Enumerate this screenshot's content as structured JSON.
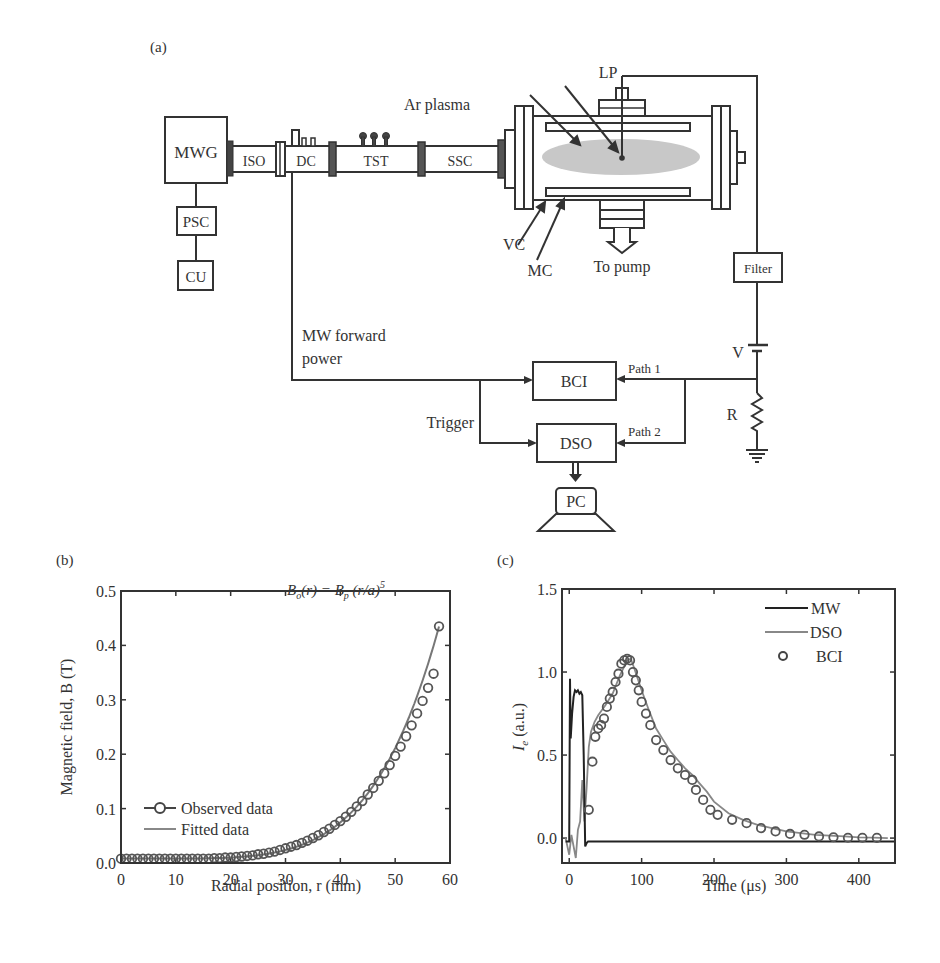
{
  "panel_a": {
    "label": "(a)",
    "components": {
      "mwg": "MWG",
      "psc": "PSC",
      "cu": "CU",
      "iso": "ISO",
      "dc": "DC",
      "tst": "TST",
      "ssc": "SSC",
      "ar_plasma": "Ar plasma",
      "lp": "LP",
      "vc": "VC",
      "mc": "MC",
      "to_pump": "To pump",
      "filter": "Filter",
      "v": "V",
      "r": "R",
      "bci": "BCI",
      "dso": "DSO",
      "pc": "PC",
      "mw_forward_power_1": "MW forward",
      "mw_forward_power_2": "power",
      "trigger": "Trigger",
      "path1": "Path 1",
      "path2": "Path 2"
    }
  },
  "chart_data": [
    {
      "panel": "(b)",
      "type": "scatter",
      "title": "",
      "annotation": "B_o(r) = B_p (r/a)^5",
      "annotation_parts": {
        "b0": "B",
        "sub0": "o",
        "mid": "(r) = ",
        "bp": "B",
        "subp": "p",
        "tail": " (r/a)",
        "sup": "5"
      },
      "xlabel": "Radial position, r (mm)",
      "ylabel": "Magnetic field, B (T)",
      "xlim": [
        0,
        60
      ],
      "ylim": [
        0,
        0.5
      ],
      "xticks": [
        "0",
        "10",
        "20",
        "30",
        "40",
        "50",
        "60"
      ],
      "yticks": [
        "0.0",
        "0.1",
        "0.2",
        "0.3",
        "0.4",
        "0.5"
      ],
      "legend": [
        "Observed data",
        "Fitted data"
      ],
      "legend_position": "lower left",
      "series": [
        {
          "name": "Observed data",
          "marker": "open-circle",
          "x": [
            0,
            1,
            2,
            3,
            4,
            5,
            6,
            7,
            8,
            9,
            10,
            11,
            12,
            13,
            14,
            15,
            16,
            17,
            18,
            19,
            20,
            21,
            22,
            23,
            24,
            25,
            26,
            27,
            28,
            29,
            30,
            31,
            32,
            33,
            34,
            35,
            36,
            37,
            38,
            39,
            40,
            41,
            42,
            43,
            44,
            45,
            46,
            47,
            48,
            49,
            50,
            51,
            52,
            53,
            54,
            55,
            56,
            57,
            58
          ],
          "y": [
            0.008,
            0.008,
            0.008,
            0.008,
            0.008,
            0.008,
            0.008,
            0.008,
            0.008,
            0.008,
            0.008,
            0.008,
            0.008,
            0.008,
            0.008,
            0.008,
            0.008,
            0.009,
            0.009,
            0.01,
            0.01,
            0.011,
            0.012,
            0.013,
            0.014,
            0.016,
            0.017,
            0.019,
            0.021,
            0.024,
            0.027,
            0.03,
            0.033,
            0.037,
            0.041,
            0.046,
            0.051,
            0.057,
            0.063,
            0.07,
            0.077,
            0.085,
            0.094,
            0.104,
            0.114,
            0.126,
            0.138,
            0.151,
            0.165,
            0.18,
            0.197,
            0.214,
            0.233,
            0.253,
            0.275,
            0.298,
            0.322,
            0.348,
            0.435
          ]
        },
        {
          "name": "Fitted data",
          "marker": "line"
        }
      ]
    },
    {
      "panel": "(c)",
      "type": "line",
      "title": "",
      "xlabel": "Time (μs)",
      "ylabel": "I_e (a.u.)",
      "ylabel_parts": {
        "main": "I",
        "sub": "e",
        "tail": " (a.u.)"
      },
      "xlim": [
        -10,
        450
      ],
      "ylim": [
        -0.15,
        1.5
      ],
      "xticks": [
        "0",
        "100",
        "200",
        "300",
        "400"
      ],
      "yticks": [
        "0.0",
        "0.5",
        "1.0",
        "1.5"
      ],
      "legend": [
        "MW",
        "DSO",
        "BCI"
      ],
      "legend_position": "upper right",
      "series": [
        {
          "name": "MW",
          "marker": "line",
          "x": [
            -5,
            0,
            1,
            2,
            4,
            6,
            8,
            10,
            12,
            14,
            16,
            18,
            20,
            22,
            24,
            26,
            30,
            100,
            200,
            300,
            400,
            450
          ],
          "y": [
            -0.02,
            -0.02,
            0.96,
            0.6,
            0.75,
            0.85,
            0.89,
            0.88,
            0.89,
            0.87,
            0.88,
            0.86,
            0.5,
            -0.05,
            -0.03,
            -0.02,
            -0.02,
            -0.02,
            -0.02,
            -0.02,
            -0.02,
            -0.02
          ]
        },
        {
          "name": "DSO",
          "marker": "line",
          "x": [
            -5,
            0,
            3,
            6,
            9,
            12,
            15,
            18,
            21,
            24,
            27,
            30,
            35,
            40,
            50,
            60,
            70,
            80,
            85,
            90,
            100,
            110,
            120,
            130,
            140,
            150,
            160,
            170,
            180,
            190,
            200,
            220,
            240,
            260,
            280,
            300,
            320,
            340,
            360,
            380,
            400,
            420,
            440
          ],
          "y": [
            0,
            -0.1,
            0.02,
            -0.05,
            -0.12,
            0.05,
            0.1,
            0.35,
            0.1,
            0.3,
            0.55,
            0.64,
            0.7,
            0.74,
            0.8,
            0.87,
            0.98,
            1.07,
            1.08,
            1.02,
            0.89,
            0.77,
            0.66,
            0.59,
            0.52,
            0.47,
            0.42,
            0.38,
            0.33,
            0.28,
            0.22,
            0.15,
            0.11,
            0.08,
            0.06,
            0.04,
            0.03,
            0.02,
            0.015,
            0.01,
            0.005,
            0.003,
            0.0
          ]
        },
        {
          "name": "BCI",
          "marker": "open-circle",
          "x": [
            27,
            32,
            36,
            40,
            44,
            48,
            52,
            56,
            60,
            64,
            68,
            72,
            76,
            80,
            84,
            88,
            92,
            96,
            100,
            106,
            112,
            120,
            130,
            140,
            150,
            160,
            170,
            175,
            185,
            195,
            205,
            225,
            245,
            265,
            285,
            305,
            325,
            345,
            365,
            385,
            405,
            425
          ],
          "y": [
            0.17,
            0.46,
            0.61,
            0.66,
            0.68,
            0.72,
            0.79,
            0.84,
            0.88,
            0.94,
            0.99,
            1.05,
            1.07,
            1.08,
            1.07,
            1.0,
            0.95,
            0.89,
            0.82,
            0.75,
            0.68,
            0.59,
            0.53,
            0.47,
            0.42,
            0.38,
            0.35,
            0.29,
            0.23,
            0.17,
            0.14,
            0.11,
            0.09,
            0.06,
            0.04,
            0.025,
            0.02,
            0.01,
            0.005,
            0.002,
            0.002,
            0.001
          ]
        }
      ]
    }
  ]
}
